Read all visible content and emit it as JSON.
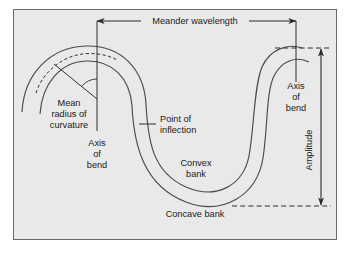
{
  "figure": {
    "type": "river-meander-schematic",
    "panel": {
      "background_color": "#e9e9e9",
      "border_color": "#6b6b6b",
      "outer_background_color": "#ffffff"
    },
    "line_color": "#3a3a3a",
    "text_color": "#1a1a1a"
  },
  "labels": {
    "meander_wavelength": "Meander wavelength",
    "mean_radius_of_curvature": {
      "line1": "Mean",
      "line2": "radius of",
      "line3": "curvature"
    },
    "axis_of_bend_left": {
      "line1": "Axis",
      "line2": "of",
      "line3": "bend"
    },
    "axis_of_bend_right": {
      "line1": "Axis",
      "line2": "of",
      "line3": "bend"
    },
    "point_of_inflection": {
      "line1": "Point of",
      "line2": "inflection"
    },
    "convex_bank": {
      "line1": "Convex",
      "line2": "bank"
    },
    "concave_bank": "Concave bank",
    "amplitude": "Amplitude"
  },
  "annotations": {
    "wavelength_measure": {
      "name": "Meander wavelength",
      "orientation": "horizontal",
      "arrow_style": "double-headed",
      "from_axis": "left axis of bend",
      "to_axis": "right axis of bend"
    },
    "amplitude_measure": {
      "name": "Amplitude",
      "orientation": "vertical",
      "arrow_style": "double-headed",
      "from_line": "crest tangent (dashed)",
      "to_line": "trough tangent (dashed)"
    },
    "radius_measure": {
      "name": "Mean radius of curvature",
      "style": "line with angle arc from bend centre to channel centreline"
    },
    "inflection_marker": {
      "name": "Point of inflection",
      "style": "short tick crossing channel centreline"
    }
  }
}
